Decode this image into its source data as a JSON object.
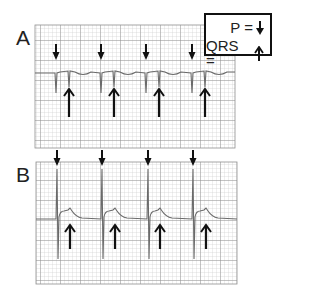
{
  "figure": {
    "panels": [
      {
        "id": "A",
        "label": "A",
        "description": "ECG strip with small pacer spikes and low-amplitude QRS",
        "grid": {
          "x": 35,
          "y": 25,
          "width": 200,
          "height": 123
        },
        "baseline_y": 73,
        "p_markers_x": [
          56,
          101,
          146,
          192
        ],
        "qrs_markers_x": [
          69,
          114,
          159,
          205
        ]
      },
      {
        "id": "B",
        "label": "B",
        "description": "ECG strip with tall spikes and QRS complexes",
        "grid": {
          "x": 36,
          "y": 162,
          "width": 201,
          "height": 122
        },
        "baseline_y": 219,
        "p_markers_x": [
          57,
          102,
          148,
          193
        ],
        "qrs_markers_x": [
          70,
          115,
          160,
          206
        ]
      }
    ],
    "legend": {
      "p_label": "P =",
      "p_symbol": "solid-down-arrow",
      "qrs_label": "QRS =",
      "qrs_symbol": "open-up-arrow"
    },
    "colors": {
      "grid_minor": "#c9c9c9",
      "grid_major": "#8f8f8f",
      "trace": "#6a6a6a",
      "arrow": "#111111"
    }
  }
}
